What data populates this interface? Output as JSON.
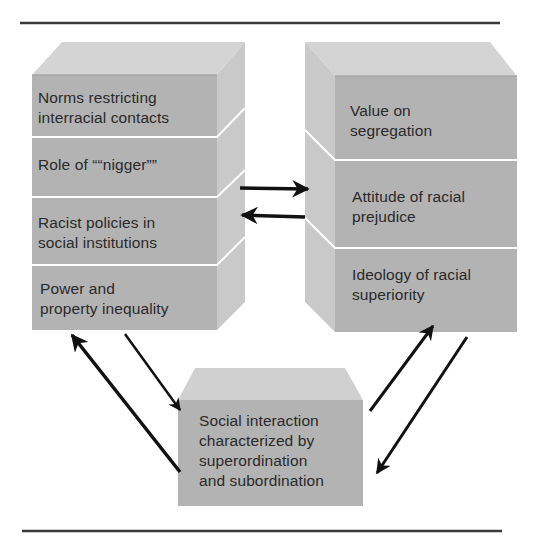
{
  "colors": {
    "front_face": "#b3b3b3",
    "top_face": "#d4d4d4",
    "side_face": "#c9c9c9",
    "divider": "#ffffff",
    "rule": "#3a3a3a",
    "arrow": "#111111",
    "text": "#2a2a2a"
  },
  "left_block": {
    "segments": [
      {
        "id": "norms",
        "lines": [
          "Norms restricting",
          "interracial contacts"
        ]
      },
      {
        "id": "role",
        "lines": [
          "Role of ““nigger””"
        ]
      },
      {
        "id": "policies",
        "lines": [
          "Racist policies in",
          "social institutions"
        ]
      },
      {
        "id": "power",
        "lines": [
          "Power and",
          "property inequality"
        ]
      }
    ]
  },
  "right_block": {
    "segments": [
      {
        "id": "value",
        "lines": [
          "Value on",
          "segregation"
        ]
      },
      {
        "id": "attitude",
        "lines": [
          "Attitude of racial",
          "prejudice"
        ]
      },
      {
        "id": "ideology",
        "lines": [
          "Ideology of racial",
          "superiority"
        ]
      }
    ]
  },
  "bottom_block": {
    "lines": [
      "Social interaction",
      "characterized by",
      "superordination",
      "and subordination"
    ]
  },
  "arrows": [
    {
      "from": "left_block",
      "to": "right_block",
      "direction": "right"
    },
    {
      "from": "right_block",
      "to": "left_block",
      "direction": "left"
    },
    {
      "from": "left_block",
      "to": "bottom_block",
      "direction": "down"
    },
    {
      "from": "bottom_block",
      "to": "left_block",
      "direction": "up"
    },
    {
      "from": "bottom_block",
      "to": "right_block",
      "direction": "up"
    },
    {
      "from": "right_block",
      "to": "bottom_block",
      "direction": "down"
    }
  ]
}
